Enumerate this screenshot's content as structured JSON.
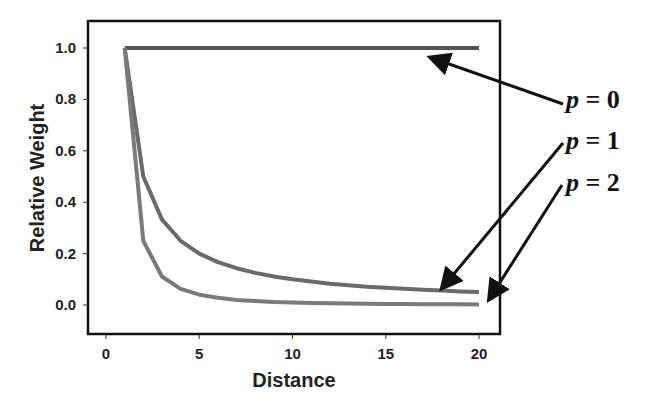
{
  "chart_data": {
    "type": "line",
    "title": "",
    "xlabel": "Distance",
    "ylabel": "Relative Weight",
    "xlim": [
      -1,
      21.2
    ],
    "ylim": [
      -0.11,
      1.07
    ],
    "xticks": [
      0,
      5,
      10,
      15,
      20
    ],
    "xtick_labels": [
      "0",
      "5",
      "10",
      "15",
      "20"
    ],
    "yticks": [
      0.0,
      0.2,
      0.4,
      0.6,
      0.8,
      1.0
    ],
    "ytick_labels": [
      "0.0",
      "0.2",
      "0.4",
      "0.6",
      "0.8",
      "1.0"
    ],
    "grid": false,
    "legend": "none (arrow annotations)",
    "x": [
      1,
      2,
      3,
      4,
      5,
      6,
      7,
      8,
      9,
      10,
      11,
      12,
      13,
      14,
      15,
      16,
      17,
      18,
      19,
      20
    ],
    "series": [
      {
        "name": "p = 0",
        "color": "#555555",
        "values": [
          1,
          1,
          1,
          1,
          1,
          1,
          1,
          1,
          1,
          1,
          1,
          1,
          1,
          1,
          1,
          1,
          1,
          1,
          1,
          1
        ]
      },
      {
        "name": "p = 1",
        "color": "#6a6a6a",
        "values": [
          1,
          0.5,
          0.333,
          0.25,
          0.2,
          0.167,
          0.143,
          0.125,
          0.111,
          0.1,
          0.091,
          0.083,
          0.077,
          0.071,
          0.067,
          0.063,
          0.059,
          0.056,
          0.053,
          0.05
        ]
      },
      {
        "name": "p = 2",
        "color": "#7a7a7a",
        "values": [
          1,
          0.25,
          0.111,
          0.063,
          0.04,
          0.028,
          0.02,
          0.016,
          0.012,
          0.01,
          0.008,
          0.007,
          0.006,
          0.005,
          0.004,
          0.004,
          0.003,
          0.003,
          0.003,
          0.0025
        ]
      }
    ],
    "annotations": [
      {
        "label_var": "p",
        "label_rest": " = 0",
        "points_to": "p = 0"
      },
      {
        "label_var": "p",
        "label_rest": " = 1",
        "points_to": "p = 1"
      },
      {
        "label_var": "p",
        "label_rest": " = 2",
        "points_to": "p = 2"
      }
    ]
  }
}
